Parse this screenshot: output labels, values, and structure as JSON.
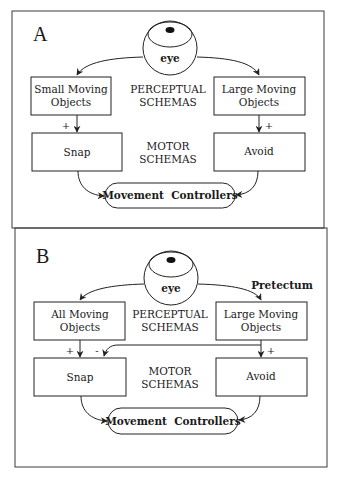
{
  "panels": [
    {
      "letter": "A",
      "eye_label": "eye",
      "perceptual_left": [
        "Small Moving",
        "Objects"
      ],
      "perceptual_right": [
        "Large Moving",
        "Objects"
      ],
      "perceptual_center": [
        "PERCEPTUAL",
        "SCHEMAS"
      ],
      "motor_left": "Snap",
      "motor_right": "Avoid",
      "motor_center": [
        "MOTOR",
        "SCHEMAS"
      ],
      "output": "Movement  Controllers",
      "sign_left": "+",
      "sign_right": "+"
    },
    {
      "letter": "B",
      "eye_label": "eye",
      "region_label": "Pretectum",
      "perceptual_left": [
        "All Moving",
        "Objects"
      ],
      "perceptual_right": [
        "Large Moving",
        "Objects"
      ],
      "perceptual_center": [
        "PERCEPTUAL",
        "SCHEMAS"
      ],
      "motor_left": "Snap",
      "motor_right": "Avoid",
      "motor_center": [
        "MOTOR",
        "SCHEMAS"
      ],
      "output": "Movement  Controllers",
      "sign_left": "+",
      "sign_inhibit": "-",
      "sign_right": "+"
    }
  ]
}
